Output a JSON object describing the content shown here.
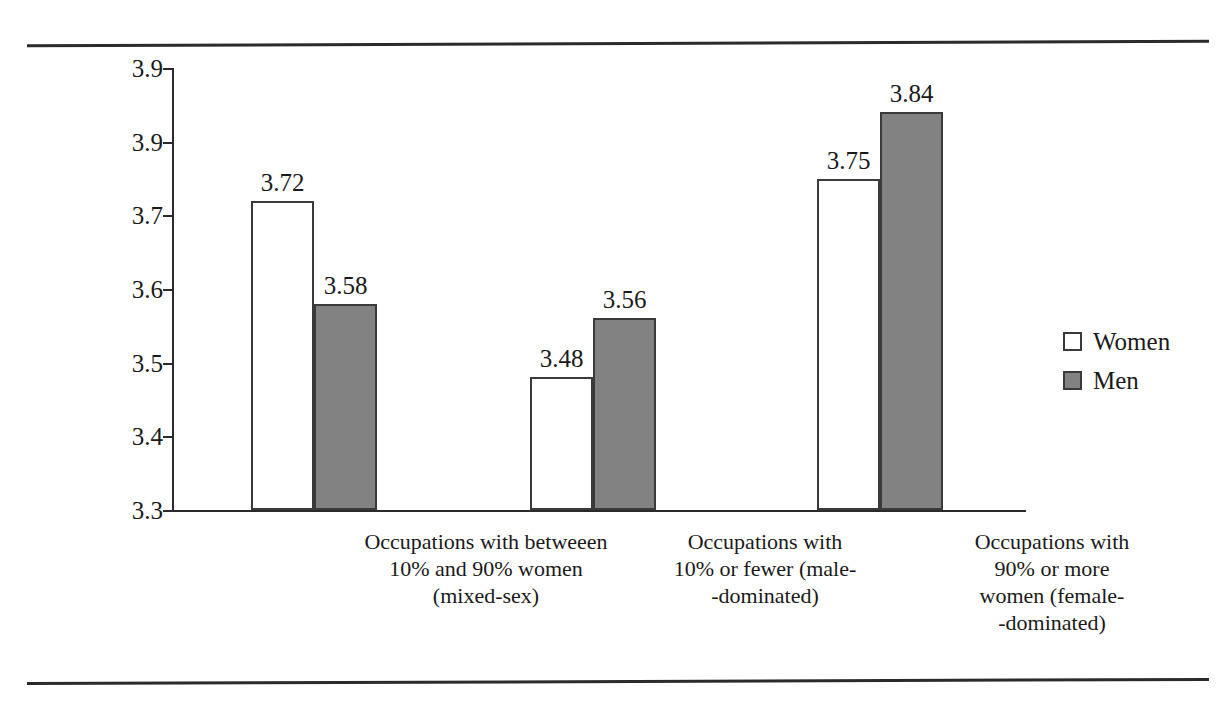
{
  "figure": {
    "rules": {
      "top_label": "page-rule-top",
      "bottom_label": "page-rule-bottom"
    }
  },
  "chart_data": {
    "type": "bar",
    "title": "",
    "xlabel": "",
    "ylabel": "Perceived Workspace Suport",
    "ylim": [
      3.3,
      3.9
    ],
    "ytick_labels": [
      "3.9",
      "3.9",
      "3.7",
      "3.6",
      "3.5",
      "3.4",
      "3.3"
    ],
    "ytick_values": [
      3.9,
      3.8,
      3.7,
      3.6,
      3.5,
      3.4,
      3.3
    ],
    "grid": false,
    "legend_position": "right",
    "categories": [
      "Occupations with betweeen 10% and 90% women (mixed-sex)",
      "Occupations with 10% or fewer (male--dominated)",
      "Occupations with 90% or more women (female--dominated)"
    ],
    "category_lines": [
      [
        "Occupations with betweeen",
        "10% and 90% women",
        "(mixed-sex)"
      ],
      [
        "Occupations with",
        "10% or fewer (male-",
        "-dominated)"
      ],
      [
        "Occupations with",
        "90% or more",
        "women (female-",
        "-dominated)"
      ]
    ],
    "series": [
      {
        "name": "Women",
        "color": "#ffffff",
        "values": [
          3.72,
          3.48,
          3.75
        ],
        "labels": [
          "3.72",
          "3.48",
          "3.75"
        ]
      },
      {
        "name": "Men",
        "color": "#828282",
        "values": [
          3.58,
          3.56,
          3.84
        ],
        "labels": [
          "3.58",
          "3.56",
          "3.84"
        ]
      }
    ],
    "legend": [
      {
        "label": "Women",
        "swatch": "open-square"
      },
      {
        "label": "Men",
        "swatch": "filled-gray-square"
      }
    ]
  }
}
